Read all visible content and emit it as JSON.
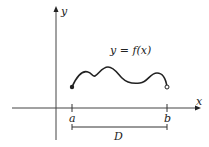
{
  "diagram": {
    "function_label": "y = f(x)",
    "x_axis_label": "x",
    "y_axis_label": "y",
    "left_endpoint_label": "a",
    "right_endpoint_label": "b",
    "domain_label": "D",
    "left_endpoint_style": "closed",
    "right_endpoint_style": "open",
    "colors": {
      "stroke": "#222222",
      "background": "#ffffff"
    }
  }
}
